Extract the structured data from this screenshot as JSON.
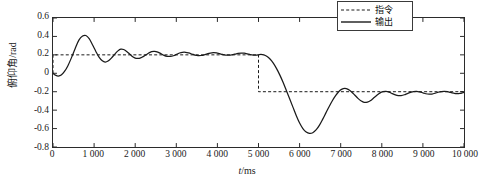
{
  "chart_data": {
    "type": "line",
    "title": "",
    "subtitle": "",
    "xlabel": "t/ms",
    "ylabel": "俯仰角/rad",
    "xlim": [
      0,
      10000
    ],
    "ylim": [
      -0.8,
      0.6
    ],
    "grid": false,
    "legend_position": "top-right",
    "x_ticks": [
      0,
      1000,
      2000,
      3000,
      4000,
      5000,
      6000,
      7000,
      8000,
      9000,
      10000
    ],
    "x_tick_labels": [
      "0",
      "1 000",
      "2 000",
      "3 000",
      "4 000",
      "5 000",
      "6 000",
      "7 000",
      "8 000",
      "9 000",
      "10 000"
    ],
    "y_ticks": [
      0.6,
      0.4,
      0.2,
      0,
      -0.2,
      -0.4,
      -0.6,
      -0.8
    ],
    "y_tick_labels": [
      "0.6",
      "0.4",
      "0.2",
      "0",
      "-0.2",
      "-0.4",
      "-0.6",
      "-0.8"
    ],
    "series": [
      {
        "name": "指令",
        "style": "dashed",
        "color": "#1a1a1a",
        "description": "Step command: 0 rad before t=0, 0.2 rad from t=0 to t=5000 ms, -0.2 rad from t=5000 to t=10000 ms",
        "points": [
          [
            0,
            0.0
          ],
          [
            0,
            0.2
          ],
          [
            5000,
            0.2
          ],
          [
            5000,
            -0.2
          ],
          [
            10000,
            -0.2
          ]
        ]
      },
      {
        "name": "输出",
        "style": "solid",
        "color": "#1a1a1a",
        "description": "Damped oscillatory pitch response tracking the command with ~0.41 rad first peak and ~-0.65 rad undershoot after the second step",
        "points": [
          [
            0,
            0.0
          ],
          [
            60,
            -0.02
          ],
          [
            130,
            -0.03
          ],
          [
            200,
            -0.02
          ],
          [
            280,
            0.02
          ],
          [
            360,
            0.08
          ],
          [
            450,
            0.17
          ],
          [
            540,
            0.27
          ],
          [
            630,
            0.36
          ],
          [
            720,
            0.405
          ],
          [
            800,
            0.41
          ],
          [
            880,
            0.375
          ],
          [
            960,
            0.31
          ],
          [
            1040,
            0.24
          ],
          [
            1120,
            0.175
          ],
          [
            1200,
            0.135
          ],
          [
            1270,
            0.122
          ],
          [
            1340,
            0.133
          ],
          [
            1420,
            0.165
          ],
          [
            1500,
            0.206
          ],
          [
            1580,
            0.243
          ],
          [
            1650,
            0.262
          ],
          [
            1720,
            0.258
          ],
          [
            1800,
            0.235
          ],
          [
            1880,
            0.203
          ],
          [
            1950,
            0.176
          ],
          [
            2020,
            0.162
          ],
          [
            2100,
            0.163
          ],
          [
            2180,
            0.178
          ],
          [
            2260,
            0.2
          ],
          [
            2330,
            0.22
          ],
          [
            2400,
            0.235
          ],
          [
            2470,
            0.238
          ],
          [
            2550,
            0.229
          ],
          [
            2630,
            0.212
          ],
          [
            2700,
            0.195
          ],
          [
            2780,
            0.184
          ],
          [
            2850,
            0.183
          ],
          [
            2930,
            0.19
          ],
          [
            3010,
            0.205
          ],
          [
            3080,
            0.22
          ],
          [
            3150,
            0.228
          ],
          [
            3230,
            0.228
          ],
          [
            3300,
            0.221
          ],
          [
            3380,
            0.209
          ],
          [
            3450,
            0.198
          ],
          [
            3530,
            0.192
          ],
          [
            3600,
            0.193
          ],
          [
            3680,
            0.2
          ],
          [
            3750,
            0.211
          ],
          [
            3830,
            0.22
          ],
          [
            3900,
            0.223
          ],
          [
            3980,
            0.221
          ],
          [
            4050,
            0.213
          ],
          [
            4130,
            0.204
          ],
          [
            4200,
            0.198
          ],
          [
            4280,
            0.196
          ],
          [
            4350,
            0.2
          ],
          [
            4430,
            0.208
          ],
          [
            4500,
            0.216
          ],
          [
            4580,
            0.22
          ],
          [
            4650,
            0.218
          ],
          [
            4730,
            0.211
          ],
          [
            4800,
            0.203
          ],
          [
            4880,
            0.198
          ],
          [
            4950,
            0.197
          ],
          [
            5000,
            0.2
          ],
          [
            5060,
            0.205
          ],
          [
            5130,
            0.2
          ],
          [
            5200,
            0.185
          ],
          [
            5280,
            0.155
          ],
          [
            5360,
            0.11
          ],
          [
            5440,
            0.05
          ],
          [
            5520,
            -0.02
          ],
          [
            5600,
            -0.1
          ],
          [
            5680,
            -0.19
          ],
          [
            5760,
            -0.28
          ],
          [
            5840,
            -0.37
          ],
          [
            5920,
            -0.46
          ],
          [
            6000,
            -0.54
          ],
          [
            6080,
            -0.6
          ],
          [
            6160,
            -0.637
          ],
          [
            6240,
            -0.652
          ],
          [
            6320,
            -0.645
          ],
          [
            6400,
            -0.615
          ],
          [
            6480,
            -0.565
          ],
          [
            6560,
            -0.5
          ],
          [
            6640,
            -0.43
          ],
          [
            6720,
            -0.36
          ],
          [
            6800,
            -0.295
          ],
          [
            6880,
            -0.24
          ],
          [
            6950,
            -0.2
          ],
          [
            7020,
            -0.175
          ],
          [
            7100,
            -0.165
          ],
          [
            7180,
            -0.175
          ],
          [
            7260,
            -0.2
          ],
          [
            7340,
            -0.235
          ],
          [
            7420,
            -0.272
          ],
          [
            7500,
            -0.3
          ],
          [
            7570,
            -0.315
          ],
          [
            7650,
            -0.312
          ],
          [
            7730,
            -0.295
          ],
          [
            7800,
            -0.268
          ],
          [
            7880,
            -0.238
          ],
          [
            7950,
            -0.215
          ],
          [
            8030,
            -0.2
          ],
          [
            8100,
            -0.197
          ],
          [
            8180,
            -0.205
          ],
          [
            8250,
            -0.22
          ],
          [
            8330,
            -0.235
          ],
          [
            8400,
            -0.243
          ],
          [
            8470,
            -0.242
          ],
          [
            8550,
            -0.233
          ],
          [
            8620,
            -0.22
          ],
          [
            8700,
            -0.207
          ],
          [
            8770,
            -0.198
          ],
          [
            8850,
            -0.196
          ],
          [
            8920,
            -0.202
          ],
          [
            9000,
            -0.212
          ],
          [
            9070,
            -0.222
          ],
          [
            9150,
            -0.227
          ],
          [
            9220,
            -0.225
          ],
          [
            9300,
            -0.216
          ],
          [
            9370,
            -0.206
          ],
          [
            9450,
            -0.198
          ],
          [
            9520,
            -0.195
          ],
          [
            9600,
            -0.199
          ],
          [
            9670,
            -0.208
          ],
          [
            9750,
            -0.216
          ],
          [
            9820,
            -0.221
          ],
          [
            9900,
            -0.219
          ],
          [
            9970,
            -0.211
          ],
          [
            10000,
            -0.206
          ]
        ]
      }
    ]
  }
}
